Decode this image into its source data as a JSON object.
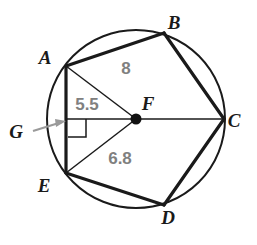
{
  "figure": {
    "background_color": "#ffffff",
    "stroke_color": "#1a1a1a",
    "measure_color": "#808080",
    "circle": {
      "center_x": 136,
      "center_y": 119,
      "radius": 89,
      "stroke_width": 2.0
    },
    "center_point": {
      "label": "F",
      "x": 136,
      "y": 119,
      "dot_radius": 5.5,
      "label_x": 148,
      "label_y": 110
    },
    "vertices": [
      {
        "label": "A",
        "x": 66,
        "y": 66,
        "label_x": 45,
        "label_y": 64
      },
      {
        "label": "B",
        "x": 164,
        "y": 33,
        "label_x": 174,
        "label_y": 29
      },
      {
        "label": "C",
        "x": 224,
        "y": 119,
        "label_x": 234,
        "label_y": 127
      },
      {
        "label": "D",
        "x": 164,
        "y": 205,
        "label_x": 168,
        "label_y": 224
      },
      {
        "label": "E",
        "x": 66,
        "y": 173,
        "label_x": 44,
        "label_y": 192
      }
    ],
    "polygon_edges": [
      {
        "name": "edge-AB",
        "from": "A",
        "to": "B"
      },
      {
        "name": "edge-BC",
        "from": "B",
        "to": "C"
      },
      {
        "name": "edge-CD",
        "from": "C",
        "to": "D"
      },
      {
        "name": "edge-DE",
        "from": "D",
        "to": "E"
      },
      {
        "name": "edge-EA",
        "from": "E",
        "to": "A"
      }
    ],
    "radii": [
      {
        "name": "radius-AF",
        "from": "A",
        "to": "F"
      },
      {
        "name": "radius-EF",
        "from": "E",
        "to": "F"
      },
      {
        "name": "radius-FC",
        "from": "F",
        "to": "C"
      }
    ],
    "apothem": {
      "name": "apothem-FG",
      "from_x": 136,
      "from_y": 119,
      "to_x": 66,
      "to_y": 119,
      "foot_label": "G",
      "foot_label_x": 16,
      "foot_label_y": 138
    },
    "right_angle_mark": {
      "name": "right-angle-at-G",
      "x": 68,
      "y": 119,
      "size": 18
    },
    "pointer": {
      "name": "g-pointer-arrow",
      "tail_x": 33,
      "tail_y": 131,
      "head_x": 66,
      "head_y": 121
    },
    "measure_labels": [
      {
        "name": "measure-chord-ab",
        "text": "8",
        "x": 126,
        "y": 74
      },
      {
        "name": "measure-apothem",
        "text": "5.5",
        "x": 87,
        "y": 110
      },
      {
        "name": "measure-radius",
        "text": "6.8",
        "x": 120,
        "y": 164
      }
    ]
  }
}
